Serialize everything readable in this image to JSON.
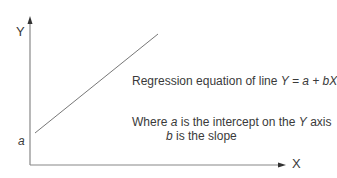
{
  "diagram": {
    "y_axis_label": "Y",
    "x_axis_label": "X",
    "intercept_label": "a",
    "equation_prefix": "Regression equation of line ",
    "equation_formula": "Y = a + bX",
    "where_prefix": "Where ",
    "where_a": "a",
    "where_a_text": " is the intercept on the ",
    "where_Y": "Y",
    "where_axis_text": " axis",
    "slope_b": "b",
    "slope_text": " is the slope",
    "colors": {
      "axis": "#777777",
      "line": "#666666",
      "text": "#3a3a3a"
    }
  }
}
